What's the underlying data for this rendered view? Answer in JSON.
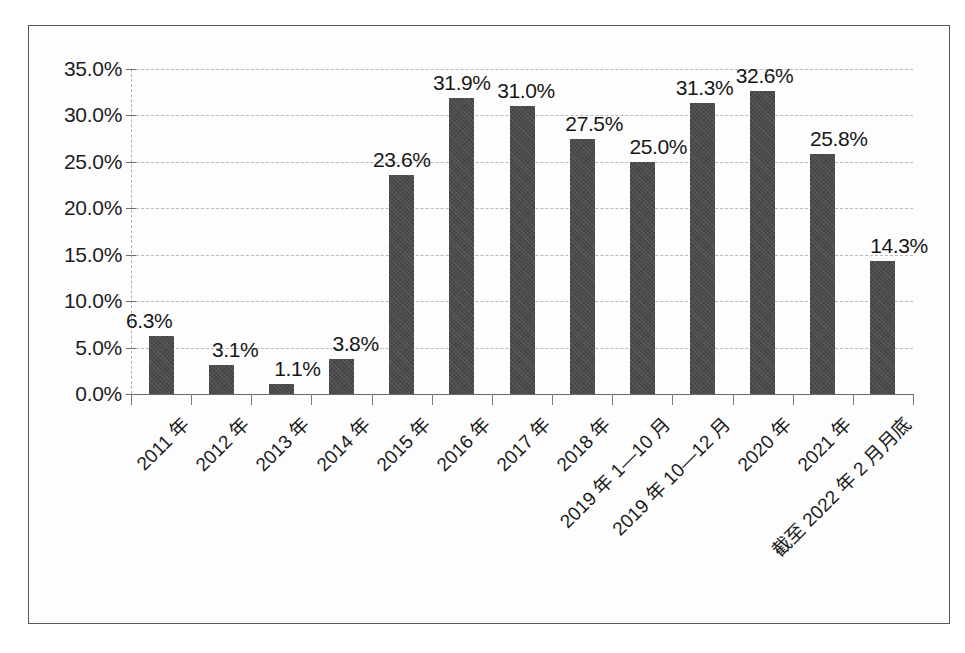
{
  "chart_data": {
    "type": "bar",
    "title": "",
    "subtitle": "",
    "xlabel": "",
    "ylabel": "",
    "ylim": [
      0,
      35
    ],
    "ytick_labels": [
      "0.0%",
      "5.0%",
      "10.0%",
      "15.0%",
      "20.0%",
      "25.0%",
      "30.0%",
      "35.0%"
    ],
    "ytick_values": [
      0,
      5,
      10,
      15,
      20,
      25,
      30,
      35
    ],
    "grid": true,
    "legend": false,
    "legend_position": "none",
    "categories": [
      "2011 年",
      "2012 年",
      "2013 年",
      "2014 年",
      "2015 年",
      "2016 年",
      "2017 年",
      "2018 年",
      "2019 年 1—10 月",
      "2019 年 10—12 月",
      "2020 年",
      "2021 年",
      "截至 2022 年 2 月月底"
    ],
    "values": [
      6.3,
      3.1,
      1.1,
      3.8,
      23.6,
      31.9,
      31.0,
      27.5,
      25.0,
      31.3,
      32.6,
      25.8,
      14.3
    ],
    "data_labels": [
      "6.3%",
      "3.1%",
      "1.1%",
      "3.8%",
      "23.6%",
      "31.9%",
      "31.0%",
      "27.5%",
      "25.0%",
      "31.3%",
      "32.6%",
      "25.8%",
      "14.3%"
    ],
    "label_offsets_px": [
      -12,
      14,
      16,
      14,
      0,
      0,
      4,
      12,
      16,
      2,
      2,
      16,
      16
    ],
    "series": [
      {
        "name": "占比",
        "values": [
          6.3,
          3.1,
          1.1,
          3.8,
          23.6,
          31.9,
          31.0,
          27.5,
          25.0,
          31.3,
          32.6,
          25.8,
          14.3
        ]
      }
    ],
    "colors": {
      "bar_fill": "#4b4b4d",
      "gridline": "#b9b9b9",
      "axis": "#6a6a6c",
      "text": "#1a1a1a",
      "background": "#fdfdfd",
      "frame_border": "#58585a"
    }
  }
}
